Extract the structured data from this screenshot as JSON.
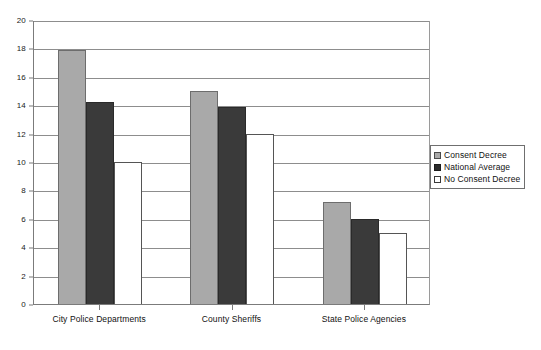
{
  "chart_data": {
    "type": "bar",
    "title": "",
    "subtitle": "",
    "xlabel": "",
    "ylabel": "",
    "categories": [
      "City Police Departments",
      "County Sheriffs",
      "State Police Agencies"
    ],
    "series": [
      {
        "name": "Consent Decree",
        "color": "#a9a9a9",
        "values": [
          17.9,
          15.0,
          7.2
        ]
      },
      {
        "name": "National Average",
        "color": "#3a3a3a",
        "values": [
          14.2,
          13.9,
          6.0
        ]
      },
      {
        "name": "No Consent Decree",
        "color": "#ffffff",
        "values": [
          10.0,
          12.0,
          5.0
        ]
      }
    ],
    "ylim": [
      0,
      20
    ],
    "ytick_step": 2,
    "yticks": [
      0,
      2,
      4,
      6,
      8,
      10,
      12,
      14,
      16,
      18,
      20
    ],
    "ytick_labels": [
      "0",
      "2",
      "4",
      "6",
      "8",
      "10",
      "12",
      "14",
      "16",
      "18",
      "20"
    ],
    "grid": {
      "horizontal": true,
      "vertical": false
    },
    "legend": {
      "position": "right",
      "visible": true
    },
    "plot_background": "#ffffff",
    "gridline_color": "#8d8d8d",
    "axis_color": "#7b7b7b"
  }
}
